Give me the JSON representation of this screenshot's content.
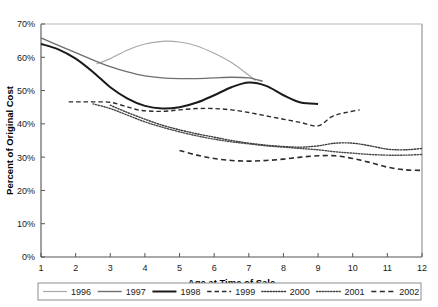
{
  "chart_data": {
    "type": "line",
    "title": "",
    "xlabel": "Age at Time of Sale",
    "ylabel": "Percent of Original Cost",
    "xlim": [
      1,
      12
    ],
    "ylim": [
      0,
      70
    ],
    "grid": false,
    "legend_position": "bottom",
    "xticks": [
      "1",
      "2",
      "3",
      "4",
      "5",
      "6",
      "7",
      "8",
      "9",
      "10",
      "11",
      "12"
    ],
    "yticks": [
      "0%",
      "10%",
      "20%",
      "30%",
      "40%",
      "50%",
      "60%",
      "70%"
    ],
    "series": [
      {
        "name": "1996",
        "color": "#a8a8a8",
        "style": "solid",
        "width": 1.2,
        "x": [
          2.6,
          3.0,
          3.5,
          4.0,
          4.5,
          5.0,
          5.5,
          6.0,
          6.5,
          7.0,
          7.2
        ],
        "values": [
          58.0,
          59.6,
          62.2,
          64.0,
          64.8,
          64.6,
          63.4,
          61.2,
          58.4,
          54.6,
          53.0
        ]
      },
      {
        "name": "1997",
        "color": "#6e6e6e",
        "style": "solid",
        "width": 1.4,
        "x": [
          1.0,
          1.5,
          2.0,
          2.5,
          3.0,
          3.5,
          4.0,
          4.5,
          5.0,
          5.5,
          6.0,
          6.5,
          7.0,
          7.4
        ],
        "values": [
          65.8,
          63.6,
          61.4,
          59.2,
          57.2,
          55.6,
          54.4,
          53.8,
          53.6,
          53.6,
          53.8,
          54.0,
          53.8,
          52.8
        ]
      },
      {
        "name": "1998",
        "color": "#1a1a1a",
        "style": "solid",
        "width": 2.0,
        "x": [
          1.0,
          1.5,
          2.0,
          2.5,
          3.0,
          3.5,
          4.0,
          4.5,
          5.0,
          5.5,
          6.0,
          6.5,
          7.0,
          7.5,
          8.0,
          8.5,
          9.0
        ],
        "values": [
          64.0,
          62.4,
          59.6,
          55.6,
          51.0,
          47.6,
          45.4,
          44.6,
          45.0,
          46.4,
          48.6,
          51.0,
          52.4,
          51.4,
          48.6,
          46.4,
          46.0
        ]
      },
      {
        "name": "1999",
        "color": "#2b2b2b",
        "style": "dashed",
        "width": 1.4,
        "x": [
          1.8,
          2.2,
          2.6,
          3.0,
          3.4,
          3.8,
          4.2,
          4.6,
          5.0,
          5.5,
          6.0,
          6.5,
          7.0,
          7.5,
          8.0,
          8.5,
          9.0,
          9.4,
          9.8,
          10.2
        ],
        "values": [
          46.6,
          46.6,
          46.6,
          46.5,
          45.4,
          44.2,
          43.8,
          43.8,
          44.2,
          44.6,
          44.6,
          44.2,
          43.4,
          42.4,
          41.4,
          40.4,
          39.4,
          42.2,
          43.4,
          44.2
        ]
      },
      {
        "name": "2000",
        "color": "#3a3a3a",
        "style": "dotted",
        "width": 1.4,
        "x": [
          3.0,
          3.5,
          4.0,
          4.5,
          5.0,
          5.5,
          6.0,
          6.5,
          7.0,
          7.5,
          8.0,
          8.5,
          9.0,
          9.5,
          10.0,
          10.5,
          11.0,
          11.5,
          12.0
        ],
        "values": [
          45.6,
          43.4,
          41.4,
          39.6,
          38.2,
          37.0,
          36.0,
          35.0,
          34.2,
          33.6,
          33.2,
          33.0,
          33.4,
          34.2,
          34.2,
          33.4,
          32.4,
          32.2,
          32.6
        ]
      },
      {
        "name": "2001",
        "color": "#4a4a4a",
        "style": "dotted",
        "width": 1.4,
        "x": [
          2.5,
          3.0,
          3.5,
          4.0,
          4.5,
          5.0,
          5.5,
          6.0,
          6.5,
          7.0,
          7.5,
          8.0,
          8.5,
          9.0,
          9.5,
          10.0,
          10.5,
          11.0,
          11.5,
          12.0
        ],
        "values": [
          46.0,
          44.6,
          42.6,
          40.6,
          39.0,
          37.6,
          36.4,
          35.4,
          34.6,
          34.0,
          33.4,
          33.0,
          32.6,
          32.2,
          31.6,
          31.2,
          30.8,
          30.6,
          30.6,
          30.8
        ]
      },
      {
        "name": "2002",
        "color": "#2b2b2b",
        "style": "dashed",
        "width": 1.6,
        "x": [
          5.0,
          5.5,
          6.0,
          6.5,
          7.0,
          7.5,
          8.0,
          8.5,
          9.0,
          9.5,
          10.0,
          10.5,
          11.0,
          11.5,
          12.0
        ],
        "values": [
          32.0,
          30.6,
          29.6,
          29.0,
          28.8,
          29.0,
          29.4,
          30.0,
          30.4,
          30.4,
          29.6,
          28.4,
          27.0,
          26.2,
          26.0
        ]
      }
    ]
  }
}
